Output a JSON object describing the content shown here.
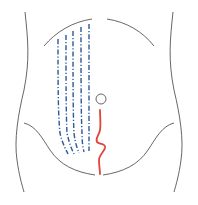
{
  "diagram": {
    "title": "",
    "colors": {
      "background": "#ffffff",
      "outline": "#555555",
      "dashed_lines": "#2c5a96",
      "incision": "#e0443a",
      "navel": "#555555"
    },
    "elements": {
      "torso_left_side": {
        "label": "torso-left-outline"
      },
      "torso_right_side": {
        "label": "torso-right-outline"
      },
      "rib_arc_left": {
        "label": "left-costal-margin"
      },
      "rib_arc_right": {
        "label": "right-costal-margin"
      },
      "pelvic_arc_left": {
        "label": "left-inguinal-curve"
      },
      "pelvic_arc_right": {
        "label": "right-inguinal-curve"
      },
      "navel": {
        "label": "umbilicus",
        "cx": 101,
        "cy": 99,
        "r": 5
      },
      "incision": {
        "label": "wavy-midline-incision",
        "style": "solid red wavy line"
      },
      "dashed_lines": {
        "count": 5,
        "style": "dash-dot blue vertical lines"
      }
    }
  }
}
